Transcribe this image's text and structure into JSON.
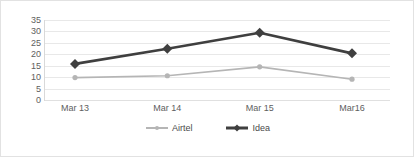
{
  "chart_data": {
    "type": "line",
    "title": "",
    "xlabel": "",
    "ylabel": "",
    "categories": [
      "Mar 13",
      "Mar 14",
      "Mar 15",
      "Mar16"
    ],
    "ylim": [
      0,
      35
    ],
    "yticks": [
      0,
      5,
      10,
      15,
      20,
      25,
      30,
      35
    ],
    "grid": "horizontal",
    "legend_position": "bottom-center",
    "series": [
      {
        "name": "Airtel",
        "color": "#b5b5b5",
        "line_width": 1.6,
        "marker": "circle",
        "marker_size": 4,
        "values": [
          9.8,
          10.6,
          14.5,
          9.1
        ]
      },
      {
        "name": "Idea",
        "color": "#3f3f3f",
        "line_width": 2.6,
        "marker": "diamond",
        "marker_size": 5,
        "values": [
          15.8,
          22.4,
          29.4,
          20.4
        ]
      }
    ]
  },
  "frame": {
    "border_color": "#e2e2e2",
    "background": "#ffffff",
    "gridline_color": "#e8e8e8",
    "tick_label_color": "#5e5e5e"
  }
}
